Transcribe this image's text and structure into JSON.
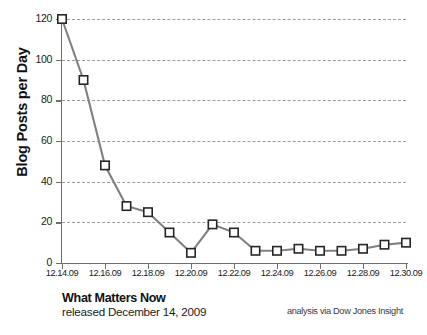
{
  "chart_data": {
    "type": "line",
    "title": "",
    "xlabel": "",
    "ylabel": "Blog Posts per Day",
    "ylim": [
      0,
      120
    ],
    "yticks": [
      0,
      20,
      40,
      60,
      80,
      100,
      120
    ],
    "ytick_labels": [
      "0",
      "20",
      "40",
      "60",
      "80",
      "100",
      "120"
    ],
    "grid": true,
    "legend": "none",
    "x": [
      "12.14.09",
      "12.15.09",
      "12.16.09",
      "12.17.09",
      "12.18.09",
      "12.19.09",
      "12.20.09",
      "12.21.09",
      "12.22.09",
      "12.23.09",
      "12.24.09",
      "12.25.09",
      "12.26.09",
      "12.27.09",
      "12.28.09",
      "12.29.09",
      "12.30.09"
    ],
    "xtick_labels": [
      "12.14.09",
      "12.16.09",
      "12.18.09",
      "12.20.09",
      "12.22.09",
      "12.24.09",
      "12.26.09",
      "12.28.09",
      "12.30.09"
    ],
    "series": [
      {
        "name": "Blog Posts per Day",
        "color": "#808080",
        "marker": "square",
        "marker_fill": "#ffffff",
        "marker_edge": "#262626",
        "values": [
          120,
          90,
          48,
          28,
          25,
          15,
          5,
          19,
          15,
          6,
          6,
          7,
          6,
          6,
          7,
          9,
          10
        ]
      }
    ]
  },
  "caption": {
    "title": "What Matters Now",
    "subtitle": "released December 14, 2009",
    "source": "analysis via Dow Jones Insight"
  }
}
